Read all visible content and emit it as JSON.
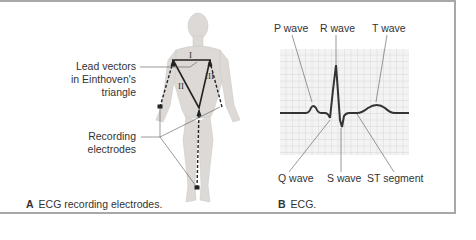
{
  "panel_a": {
    "letter": "A",
    "caption": "ECG recording electrodes.",
    "labels": {
      "lead_vectors_line1": "Lead vectors",
      "lead_vectors_line2": "in Einthoven's",
      "lead_vectors_line3": "triangle",
      "recording_line1": "Recording",
      "recording_line2": "electrodes"
    },
    "leads": [
      "I",
      "II",
      "III"
    ]
  },
  "panel_b": {
    "letter": "B",
    "caption": "ECG.",
    "labels": {
      "p_wave": "P wave",
      "r_wave": "R wave",
      "t_wave": "T wave",
      "q_wave": "Q wave",
      "s_wave": "S wave",
      "st_segment": "ST segment"
    }
  },
  "colors": {
    "border": "#a8a8a8",
    "grid_bg": "#f2f2f2",
    "grid_line": "#c8c8c8",
    "trace": "#333333",
    "skin": "#d9d6d3"
  }
}
